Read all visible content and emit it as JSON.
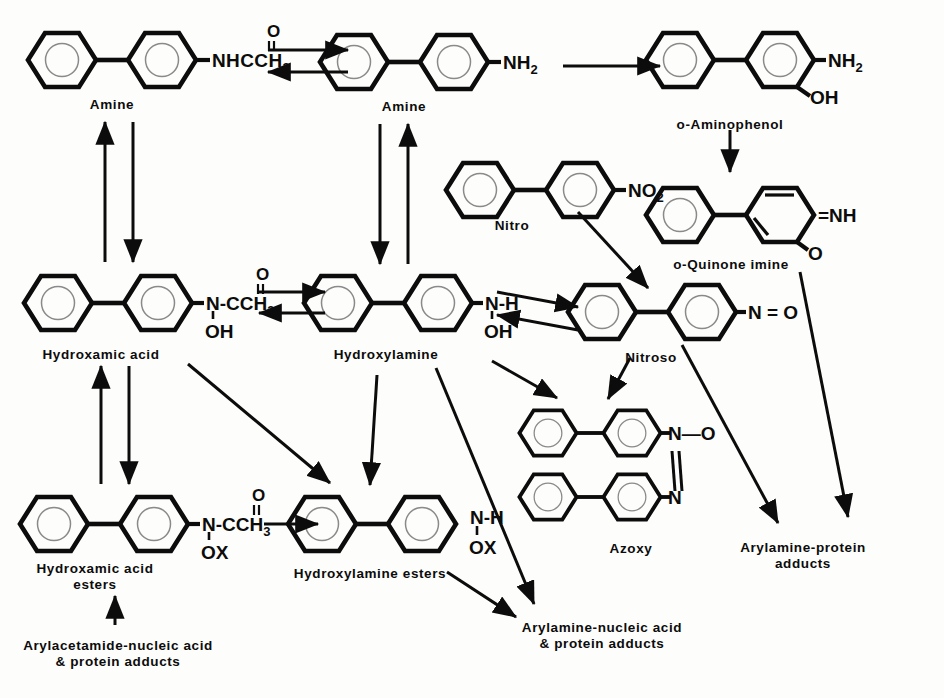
{
  "diagram": {
    "background_color": "#fdfdfb",
    "ink_color": "#0c0c0c",
    "width": 944,
    "height": 698
  },
  "nodes": [
    {
      "id": "acetamide",
      "label": "Amine",
      "substituent": "NHCCH3",
      "substituent_display": "NHCCH",
      "substituent_sub": "3",
      "carbonyl_o": "O",
      "carbonyl_bond": "double",
      "scaffold": "biphenyl",
      "x": 112,
      "y": 60
    },
    {
      "id": "amine",
      "label": "Amine",
      "substituent": "NH2",
      "substituent_display": "NH",
      "substituent_sub": "2",
      "scaffold": "biphenyl",
      "x": 404,
      "y": 62
    },
    {
      "id": "aminophenol",
      "label": "o-Aminophenol",
      "substituent": "NH2",
      "substituent_display": "NH",
      "substituent_sub": "2",
      "substituent2": "OH",
      "scaffold": "biphenyl",
      "x": 730,
      "y": 60
    },
    {
      "id": "quinoneimine",
      "label": "o-Quinone imine",
      "substituent": "=NH",
      "substituent2": "O",
      "scaffold": "quinone-phenyl",
      "x": 730,
      "y": 215
    },
    {
      "id": "nitro",
      "label": "Nitro",
      "substituent": "NO2",
      "substituent_display": "NO",
      "substituent_sub": "2",
      "scaffold": "biphenyl",
      "x": 530,
      "y": 190
    },
    {
      "id": "hydroxamicacid",
      "label": "Hydroxamic acid",
      "substituent": "N-CCH3",
      "substituent_display": "N-CCH",
      "substituent_sub": "3",
      "carbonyl_o": "O",
      "hydroxy": "OH",
      "scaffold": "biphenyl",
      "x": 108,
      "y": 303
    },
    {
      "id": "hydroxylamine",
      "label": "Hydroxylamine",
      "substituent": "N-H",
      "hydroxy": "OH",
      "scaffold": "biphenyl",
      "x": 388,
      "y": 303
    },
    {
      "id": "nitroso",
      "label": "Nitroso",
      "substituent": "N = O",
      "scaffold": "biphenyl",
      "x": 652,
      "y": 312
    },
    {
      "id": "azoxy",
      "label": "Azoxy",
      "substituent_top": "N—O",
      "substituent_bottom": "N",
      "scaffold": "bis-biphenyl-azoxy",
      "x": 632,
      "y": 465
    },
    {
      "id": "hydroxamicesters",
      "label": "Hydroxamic acid\nesters",
      "substituent": "N-CCH3",
      "substituent_display": "N-CCH",
      "substituent_sub": "3",
      "carbonyl_o": "O",
      "hydroxy": "OX",
      "scaffold": "biphenyl",
      "x": 104,
      "y": 524
    },
    {
      "id": "hydroxylamineesters",
      "label": "Hydroxylamine esters",
      "substituent": "N-H",
      "hydroxy": "OX",
      "scaffold": "biphenyl",
      "x": 372,
      "y": 524
    }
  ],
  "terminal_labels": [
    {
      "id": "arylacetamide-adducts",
      "text": "Arylacetamide-nucleic acid\n& protein adducts",
      "x": 118,
      "y": 648
    },
    {
      "id": "arylamine-nucleic-adducts",
      "text": "Arylamine-nucleic acid\n& protein adducts",
      "x": 602,
      "y": 630
    },
    {
      "id": "arylamine-protein-adducts",
      "text": "Arylamine-protein\nadducts",
      "x": 803,
      "y": 557
    }
  ],
  "structure_labels": [
    {
      "id": "label-amine-acetamide",
      "text": "Amine",
      "x": 112,
      "y": 97
    },
    {
      "id": "label-amine",
      "text": "Amine",
      "x": 404,
      "y": 99
    },
    {
      "id": "label-aminophenol",
      "text": "o-Aminophenol",
      "x": 730,
      "y": 117
    },
    {
      "id": "label-nitro",
      "text": "Nitro",
      "x": 512,
      "y": 218
    },
    {
      "id": "label-quinone-imine",
      "text": "o-Quinone imine",
      "x": 731,
      "y": 257
    },
    {
      "id": "label-hydroxamic-acid",
      "text": "Hydroxamic acid",
      "x": 101,
      "y": 347
    },
    {
      "id": "label-hydroxylamine",
      "text": "Hydroxylamine",
      "x": 386,
      "y": 347
    },
    {
      "id": "label-nitroso",
      "text": "Nitroso",
      "x": 651,
      "y": 350
    },
    {
      "id": "label-azoxy",
      "text": "Azoxy",
      "x": 631,
      "y": 541
    },
    {
      "id": "label-hydroxamic-esters",
      "text": "Hydroxamic acid\nesters",
      "x": 95,
      "y": 561
    },
    {
      "id": "label-hydroxylamine-esters",
      "text": "Hydroxylamine esters",
      "x": 370,
      "y": 566
    }
  ],
  "arrows": [
    {
      "id": "acetamide-to-amine",
      "type": "equilibrium-horizontal",
      "from": "acetamide",
      "to": "amine"
    },
    {
      "id": "amine-to-aminophenol",
      "type": "single",
      "from": "amine",
      "to": "aminophenol"
    },
    {
      "id": "aminophenol-to-quinoneimine",
      "type": "single-down",
      "from": "aminophenol",
      "to": "quinoneimine"
    },
    {
      "id": "acetamide-hydroxamic-reversible",
      "type": "double-vertical",
      "from": "acetamide",
      "to": "hydroxamicacid"
    },
    {
      "id": "amine-hydroxylamine-reversible",
      "type": "double-vertical",
      "from": "amine",
      "to": "hydroxylamine"
    },
    {
      "id": "hydroxamic-to-hydroxylamine",
      "type": "equilibrium-horizontal",
      "from": "hydroxamicacid",
      "to": "hydroxylamine"
    },
    {
      "id": "hydroxylamine-to-nitroso",
      "type": "equilibrium-slanted",
      "from": "hydroxylamine",
      "to": "nitroso"
    },
    {
      "id": "nitro-to-nitroso",
      "type": "single-diagonal",
      "from": "nitro",
      "to": "nitroso"
    },
    {
      "id": "quinoneimine-to-protein-adducts",
      "type": "single-diagonal",
      "from": "quinoneimine",
      "to": "arylamine-protein-adducts"
    },
    {
      "id": "nitroso-to-protein-adducts",
      "type": "single-diagonal",
      "from": "nitroso",
      "to": "arylamine-protein-adducts"
    },
    {
      "id": "nitroso-to-azoxy",
      "type": "single-diagonal",
      "from": "nitroso",
      "to": "azoxy"
    },
    {
      "id": "hydroxylamine-to-azoxy",
      "type": "single-diagonal",
      "from": "hydroxylamine",
      "to": "azoxy"
    },
    {
      "id": "hydroxylamine-to-esters",
      "type": "single-down",
      "from": "hydroxylamine",
      "to": "hydroxylamineesters"
    },
    {
      "id": "hydroxamic-to-esters",
      "type": "double-vertical",
      "from": "hydroxamicacid",
      "to": "hydroxamicesters"
    },
    {
      "id": "hydroxamic-to-hydroxylamine-esters",
      "type": "single-diagonal",
      "from": "hydroxamicacid",
      "to": "hydroxylamineesters"
    },
    {
      "id": "hydroxamic-esters-to-hydroxylamine-esters",
      "type": "single",
      "from": "hydroxamicesters",
      "to": "hydroxylamineesters"
    },
    {
      "id": "adducts-to-hydroxamic-esters",
      "type": "single-up",
      "from": "arylacetamide-adducts",
      "to": "hydroxamicesters"
    },
    {
      "id": "hydroxylamine-to-nucleic-adducts",
      "type": "single-diagonal",
      "from": "hydroxylamine",
      "to": "arylamine-nucleic-adducts"
    },
    {
      "id": "hydroxylamine-esters-to-nucleic-adducts",
      "type": "single-diagonal",
      "from": "hydroxylamineesters",
      "to": "arylamine-nucleic-adducts"
    }
  ],
  "groups": {
    "nhcch3": "NHCCH",
    "sub3": "3",
    "sub2": "2",
    "o": "O",
    "oh": "OH",
    "ox": "OX",
    "nh": "NH",
    "no": "NO",
    "n_ccH3": "N-CCH",
    "n_h": "N-H",
    "n_eq_o": "N = O",
    "eq_nh": "=NH",
    "n_dash_o": "N",
    "n": "N"
  }
}
